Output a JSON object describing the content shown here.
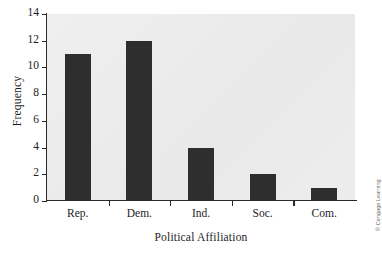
{
  "chart_data": {
    "type": "bar",
    "title": "",
    "xlabel": "Political Affiliation",
    "ylabel": "Frequency",
    "categories": [
      "Rep.",
      "Dem.",
      "Ind.",
      "Soc.",
      "Com."
    ],
    "values": [
      11,
      12,
      4,
      2,
      1
    ],
    "series": [
      {
        "name": "Frequency",
        "values": [
          11,
          12,
          4,
          2,
          1
        ]
      }
    ],
    "ylim": [
      0,
      14
    ],
    "ytick_labels": [
      "0",
      "2",
      "4",
      "6",
      "8",
      "10",
      "12",
      "14"
    ],
    "ytick_values": [
      0,
      2,
      4,
      6,
      8,
      10,
      12,
      14
    ],
    "ytick_step": 2,
    "grid": false,
    "legend": "none",
    "bar_color": "#2e2e2e",
    "plot_background": "#ececec",
    "axis_color": "#2a2a2a",
    "text_color": "#1d1d1d"
  },
  "credit": {
    "text": "© Cengage Learning",
    "color": "#6e6e6e"
  }
}
